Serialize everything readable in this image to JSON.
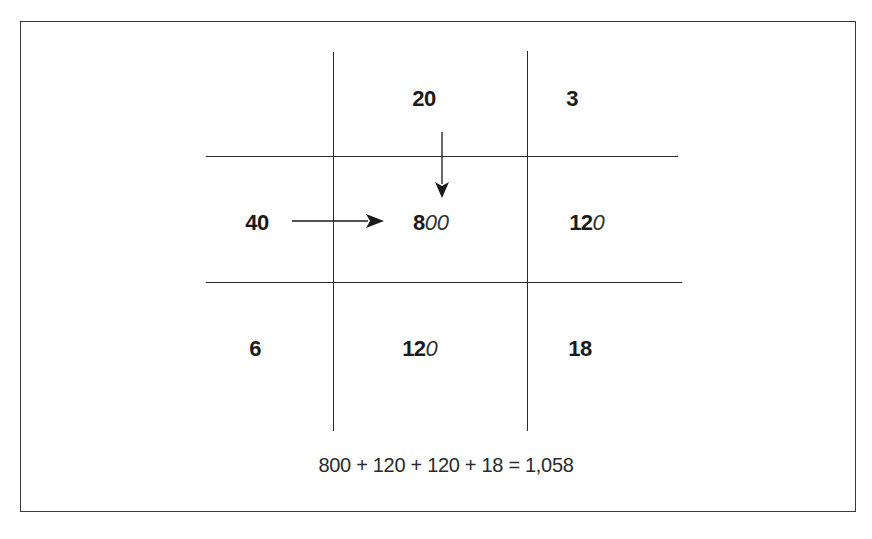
{
  "diagram": {
    "type": "area-model-multiplication",
    "grid": {
      "top_headers": [
        {
          "bold": "20",
          "italic": ""
        },
        {
          "bold": "3",
          "italic": ""
        }
      ],
      "left_headers": [
        {
          "bold": "40",
          "italic": ""
        },
        {
          "bold": "6",
          "italic": ""
        }
      ],
      "cells": [
        [
          {
            "bold": "8",
            "italic": "00"
          },
          {
            "bold": "12",
            "italic": "0"
          }
        ],
        [
          {
            "bold": "12",
            "italic": "0"
          },
          {
            "bold": "18",
            "italic": ""
          }
        ]
      ]
    },
    "arrows": [
      {
        "from": "left_header_40",
        "to": "cell_800",
        "direction": "right"
      },
      {
        "from": "top_header_20",
        "to": "cell_800",
        "direction": "down"
      }
    ],
    "equation": "800 + 120 + 120 + 18 = 1,058",
    "colors": {
      "line": "#2a2a2a",
      "text": "#1a1a1a",
      "background": "#ffffff"
    }
  }
}
